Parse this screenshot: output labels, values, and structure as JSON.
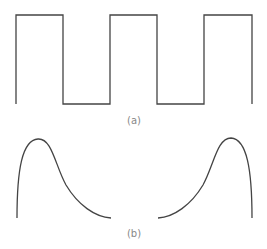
{
  "figure": {
    "panel_a": {
      "label": "(a)",
      "description": "square wave"
    },
    "panel_b": {
      "label": "(b)",
      "description": "two skewed pulse curves"
    }
  },
  "colors": {
    "stroke": "#444444",
    "label": "#888888"
  }
}
